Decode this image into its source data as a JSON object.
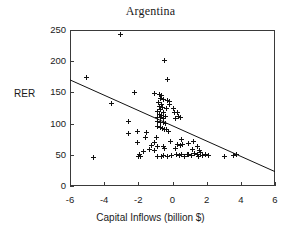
{
  "chart_data": {
    "type": "scatter",
    "title": "Argentina",
    "xlabel": "Capital Inflows (billion $)",
    "ylabel": "RER",
    "xlim": [
      -6,
      6
    ],
    "ylim": [
      0,
      250
    ],
    "xticks": [
      -6,
      -4,
      -2,
      0,
      2,
      4,
      6
    ],
    "yticks": [
      0,
      50,
      100,
      150,
      200,
      250
    ],
    "xtick_labels": [
      "-6",
      "-4",
      "-2",
      "0",
      "2",
      "4",
      "6"
    ],
    "ytick_labels": [
      "0",
      "50",
      "100",
      "150",
      "200",
      "250"
    ],
    "grid": false,
    "legend": "none",
    "marker": "plus",
    "marker_color": "#111111",
    "frame_color": "#3a3a3a",
    "background_color": "#ffffff",
    "series": [
      {
        "name": "RER vs Capital Inflows",
        "points": [
          [
            -3.05,
            242
          ],
          [
            -0.45,
            201
          ],
          [
            -5.05,
            174
          ],
          [
            -0.3,
            171
          ],
          [
            -2.25,
            150
          ],
          [
            -1.05,
            148
          ],
          [
            -0.75,
            146
          ],
          [
            -0.62,
            145
          ],
          [
            -0.7,
            141
          ],
          [
            -0.55,
            139
          ],
          [
            -0.3,
            137
          ],
          [
            -0.8,
            134
          ],
          [
            -3.55,
            133
          ],
          [
            -0.65,
            131
          ],
          [
            -0.15,
            130
          ],
          [
            -0.75,
            128
          ],
          [
            -0.6,
            126
          ],
          [
            -0.35,
            124
          ],
          [
            -0.2,
            136
          ],
          [
            -0.7,
            122
          ],
          [
            -0.85,
            120
          ],
          [
            -0.5,
            118
          ],
          [
            0.05,
            124
          ],
          [
            0.1,
            117
          ],
          [
            -0.78,
            114
          ],
          [
            -0.62,
            113
          ],
          [
            -0.4,
            112
          ],
          [
            0.3,
            118
          ],
          [
            0.35,
            112
          ],
          [
            -2.55,
            104
          ],
          [
            -0.85,
            110
          ],
          [
            -0.68,
            109
          ],
          [
            -0.5,
            108
          ],
          [
            0.18,
            108
          ],
          [
            0.45,
            110
          ],
          [
            -0.9,
            104
          ],
          [
            -0.72,
            102
          ],
          [
            -0.55,
            101
          ],
          [
            -0.4,
            100
          ],
          [
            -0.88,
            96
          ],
          [
            -0.7,
            94
          ],
          [
            -0.58,
            92
          ],
          [
            -0.45,
            91
          ],
          [
            -0.35,
            90
          ],
          [
            -2.6,
            84
          ],
          [
            -2.05,
            88
          ],
          [
            -1.55,
            85
          ],
          [
            -0.25,
            88
          ],
          [
            -1.58,
            78
          ],
          [
            -0.95,
            77
          ],
          [
            -2.05,
            70
          ],
          [
            -1.05,
            70
          ],
          [
            -0.1,
            72
          ],
          [
            0.55,
            74
          ],
          [
            1.2,
            72
          ],
          [
            -1.25,
            65
          ],
          [
            -0.85,
            63
          ],
          [
            -0.55,
            64
          ],
          [
            0.3,
            66
          ],
          [
            0.45,
            65
          ],
          [
            0.6,
            67
          ],
          [
            0.95,
            68
          ],
          [
            1.45,
            64
          ],
          [
            -1.35,
            58
          ],
          [
            -1.7,
            56
          ],
          [
            -1.05,
            57
          ],
          [
            -0.45,
            60
          ],
          [
            0.15,
            60
          ],
          [
            1.15,
            58
          ],
          [
            1.6,
            57
          ],
          [
            -4.6,
            46
          ],
          [
            -2.0,
            48
          ],
          [
            -1.85,
            47
          ],
          [
            -1.95,
            51
          ],
          [
            -0.9,
            47
          ],
          [
            -0.65,
            48
          ],
          [
            -0.5,
            49
          ],
          [
            -0.3,
            48
          ],
          [
            0.25,
            50
          ],
          [
            0.4,
            49
          ],
          [
            0.55,
            50
          ],
          [
            0.7,
            48
          ],
          [
            0.95,
            51
          ],
          [
            1.1,
            49
          ],
          [
            1.3,
            52
          ],
          [
            1.45,
            50
          ],
          [
            1.55,
            48
          ],
          [
            1.75,
            49
          ],
          [
            1.95,
            51
          ],
          [
            2.1,
            49
          ],
          [
            3.05,
            48
          ],
          [
            3.55,
            49
          ],
          [
            3.75,
            50
          ],
          [
            -0.05,
            49
          ],
          [
            0.85,
            50
          ],
          [
            1.65,
            53
          ]
        ]
      }
    ],
    "trendline": {
      "name": "fitted regression line",
      "x_start": -6,
      "y_start": 170,
      "x_end": 6,
      "y_end": 23,
      "color": "#111111"
    }
  }
}
